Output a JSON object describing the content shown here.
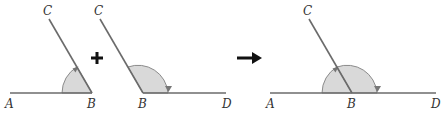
{
  "diagram": {
    "colors": {
      "line": "#6b6b6b",
      "sector_fill": "#d9d9d9",
      "arrow": "#777777",
      "operator": "#111111"
    },
    "figure1": {
      "labels": {
        "a": "A",
        "b": "B",
        "c": "C"
      }
    },
    "operator_plus": "+",
    "figure2": {
      "labels": {
        "b": "B",
        "c": "C",
        "d": "D"
      }
    },
    "operator_arrow": "→",
    "figure3": {
      "labels": {
        "a": "A",
        "b": "B",
        "c": "C",
        "d": "D"
      }
    }
  }
}
